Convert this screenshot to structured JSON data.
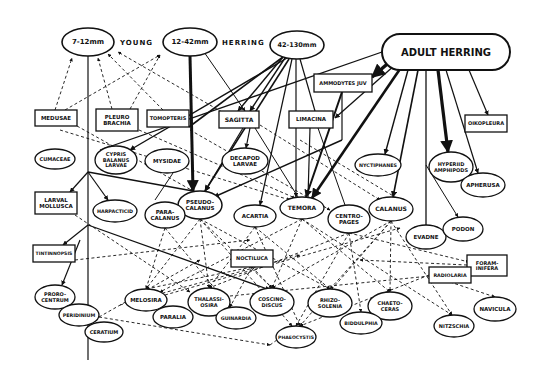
{
  "title_parts": {
    "young": "YOUNG",
    "herring": "HERRING"
  },
  "colors": {
    "ink": "#111111",
    "background": "#ffffff"
  },
  "nodes": [
    {
      "id": "n7_12",
      "shape": "ellipse",
      "cx": 88,
      "cy": 42,
      "rx": 26,
      "ry": 14,
      "lines": [
        "7-12mm"
      ],
      "fs": 7,
      "sw": 1.6
    },
    {
      "id": "n12_42",
      "shape": "ellipse",
      "cx": 190,
      "cy": 42,
      "rx": 27,
      "ry": 14,
      "lines": [
        "12-42mm"
      ],
      "fs": 7,
      "sw": 1.6
    },
    {
      "id": "n42_130",
      "shape": "ellipse",
      "cx": 297,
      "cy": 45,
      "rx": 27,
      "ry": 14,
      "lines": [
        "42-130mm"
      ],
      "fs": 6.5,
      "sw": 1.6
    },
    {
      "id": "adult",
      "shape": "rounded",
      "x": 382,
      "y": 34,
      "w": 128,
      "h": 36,
      "lines": [
        "ADULT HERRING"
      ],
      "fs": 10,
      "sw": 2
    },
    {
      "id": "ammodytes",
      "shape": "rect",
      "x": 314,
      "y": 74,
      "w": 58,
      "h": 18,
      "lines": [
        "AMMODYTES JUV"
      ],
      "fs": 5,
      "sw": 1.3
    },
    {
      "id": "medusae",
      "shape": "rect",
      "x": 35,
      "y": 110,
      "w": 42,
      "h": 16,
      "lines": [
        "MEDUSAE"
      ],
      "fs": 5.5,
      "sw": 1.3
    },
    {
      "id": "pleuro",
      "shape": "rect",
      "x": 96,
      "y": 109,
      "w": 42,
      "h": 22,
      "lines": [
        "PLEURO",
        "BRACHIA"
      ],
      "fs": 5.5,
      "sw": 1.3
    },
    {
      "id": "tomopteris",
      "shape": "rect",
      "x": 147,
      "y": 110,
      "w": 42,
      "h": 17,
      "lines": [
        "TOMOPTERIS"
      ],
      "fs": 5,
      "sw": 1.3
    },
    {
      "id": "sagitta",
      "shape": "rect",
      "x": 219,
      "y": 111,
      "w": 40,
      "h": 17,
      "lines": [
        "SAGITTA"
      ],
      "fs": 6,
      "sw": 1.3
    },
    {
      "id": "limacina",
      "shape": "rect",
      "x": 289,
      "y": 111,
      "w": 44,
      "h": 17,
      "lines": [
        "LIMACINA"
      ],
      "fs": 5.5,
      "sw": 1.3
    },
    {
      "id": "oikopleura",
      "shape": "rect",
      "x": 465,
      "y": 115,
      "w": 42,
      "h": 17,
      "lines": [
        "OIKOPLEURA"
      ],
      "fs": 5,
      "sw": 1.3
    },
    {
      "id": "cumaceae",
      "shape": "ellipse",
      "cx": 55,
      "cy": 159,
      "rx": 20,
      "ry": 10,
      "lines": [
        "CUMACEAE"
      ],
      "fs": 5,
      "sw": 1.3
    },
    {
      "id": "cypris",
      "shape": "ellipse",
      "cx": 116,
      "cy": 160,
      "rx": 21,
      "ry": 14,
      "lines": [
        "CYPRIS",
        "BALANUS",
        "LARVAE"
      ],
      "fs": 5,
      "sw": 1.3
    },
    {
      "id": "mysidae",
      "shape": "ellipse",
      "cx": 167,
      "cy": 161,
      "rx": 22,
      "ry": 12,
      "lines": [
        "MYSIDAE"
      ],
      "fs": 5.5,
      "sw": 1.3
    },
    {
      "id": "decapod",
      "shape": "ellipse",
      "cx": 245,
      "cy": 161,
      "rx": 23,
      "ry": 13,
      "lines": [
        "DECAPOD",
        "LARVAE"
      ],
      "fs": 5.5,
      "sw": 1.3
    },
    {
      "id": "nyctiphanes",
      "shape": "ellipse",
      "cx": 378,
      "cy": 165,
      "rx": 23,
      "ry": 11,
      "lines": [
        "NYCTIPHANES"
      ],
      "fs": 4.8,
      "sw": 1.3
    },
    {
      "id": "hyperiid",
      "shape": "ellipse",
      "cx": 451,
      "cy": 167,
      "rx": 22,
      "ry": 15,
      "lines": [
        "HYPERIID",
        "AMPHIPODS"
      ],
      "fs": 5,
      "sw": 1.3
    },
    {
      "id": "apherusa",
      "shape": "ellipse",
      "cx": 483,
      "cy": 185,
      "rx": 22,
      "ry": 12,
      "lines": [
        "APHERUSA"
      ],
      "fs": 5.5,
      "sw": 1.3
    },
    {
      "id": "larval_mollusca",
      "shape": "rect",
      "x": 35,
      "y": 192,
      "w": 42,
      "h": 22,
      "lines": [
        "LARVAL",
        "MOLLUSCA"
      ],
      "fs": 5.5,
      "sw": 1.3
    },
    {
      "id": "harpacticid",
      "shape": "ellipse",
      "cx": 115,
      "cy": 211,
      "rx": 22,
      "ry": 11,
      "lines": [
        "HARPACTICID"
      ],
      "fs": 4.8,
      "sw": 1.3
    },
    {
      "id": "pseudocalanus",
      "shape": "ellipse",
      "cx": 200,
      "cy": 205,
      "rx": 22,
      "ry": 14,
      "lines": [
        "PSEUDO-",
        "CALANUS"
      ],
      "fs": 5.5,
      "sw": 1.5
    },
    {
      "id": "paracalanus",
      "shape": "ellipse",
      "cx": 165,
      "cy": 215,
      "rx": 20,
      "ry": 13,
      "lines": [
        "PARA-",
        "CALANUS"
      ],
      "fs": 5.5,
      "sw": 1.3
    },
    {
      "id": "acartia",
      "shape": "ellipse",
      "cx": 255,
      "cy": 216,
      "rx": 21,
      "ry": 11,
      "lines": [
        "ACARTIA"
      ],
      "fs": 5.5,
      "sw": 1.3
    },
    {
      "id": "temora",
      "shape": "ellipse",
      "cx": 302,
      "cy": 208,
      "rx": 22,
      "ry": 11,
      "lines": [
        "TEMORA"
      ],
      "fs": 6,
      "sw": 1.3
    },
    {
      "id": "centropages",
      "shape": "ellipse",
      "cx": 349,
      "cy": 219,
      "rx": 21,
      "ry": 14,
      "lines": [
        "CENTRO-",
        "PAGES"
      ],
      "fs": 5.5,
      "sw": 1.3
    },
    {
      "id": "calanus",
      "shape": "ellipse",
      "cx": 391,
      "cy": 209,
      "rx": 22,
      "ry": 12,
      "lines": [
        "CALANUS"
      ],
      "fs": 6,
      "sw": 1.3
    },
    {
      "id": "evadne",
      "shape": "ellipse",
      "cx": 426,
      "cy": 237,
      "rx": 20,
      "ry": 12,
      "lines": [
        "EVADNE"
      ],
      "fs": 5.5,
      "sw": 1.3
    },
    {
      "id": "podon",
      "shape": "ellipse",
      "cx": 463,
      "cy": 229,
      "rx": 20,
      "ry": 12,
      "lines": [
        "PODON"
      ],
      "fs": 5.5,
      "sw": 1.3
    },
    {
      "id": "tintinnopsis",
      "shape": "rect",
      "x": 33,
      "y": 245,
      "w": 42,
      "h": 17,
      "lines": [
        "TINTINNOPSIS"
      ],
      "fs": 4.6,
      "sw": 1.3
    },
    {
      "id": "noctiluca",
      "shape": "rect",
      "x": 231,
      "y": 250,
      "w": 42,
      "h": 17,
      "lines": [
        "NOCTILUCA"
      ],
      "fs": 5,
      "sw": 1.3
    },
    {
      "id": "foraminifera",
      "shape": "rect",
      "x": 467,
      "y": 255,
      "w": 40,
      "h": 21,
      "lines": [
        "FORAM-",
        "INIFERA"
      ],
      "fs": 5,
      "sw": 1.3
    },
    {
      "id": "radiolaria",
      "shape": "rect",
      "x": 429,
      "y": 267,
      "w": 42,
      "h": 16,
      "lines": [
        "RADIOLARIA"
      ],
      "fs": 4.8,
      "sw": 1.3
    },
    {
      "id": "prorocentrum",
      "shape": "ellipse",
      "cx": 55,
      "cy": 297,
      "rx": 20,
      "ry": 12,
      "lines": [
        "PRORO-",
        "CENTRUM"
      ],
      "fs": 5,
      "sw": 1.3
    },
    {
      "id": "peridinium",
      "shape": "ellipse",
      "cx": 79,
      "cy": 315,
      "rx": 20,
      "ry": 11,
      "lines": [
        "PERIDINIUM"
      ],
      "fs": 4.8,
      "sw": 1.3
    },
    {
      "id": "ceratium",
      "shape": "ellipse",
      "cx": 104,
      "cy": 332,
      "rx": 19,
      "ry": 10,
      "lines": [
        "CERATIUM"
      ],
      "fs": 5,
      "sw": 1.3
    },
    {
      "id": "melosira",
      "shape": "ellipse",
      "cx": 146,
      "cy": 300,
      "rx": 21,
      "ry": 11,
      "lines": [
        "MELOSIRA"
      ],
      "fs": 5.5,
      "sw": 1.3
    },
    {
      "id": "paralia",
      "shape": "ellipse",
      "cx": 173,
      "cy": 317,
      "rx": 20,
      "ry": 11,
      "lines": [
        "PARALIA"
      ],
      "fs": 5.5,
      "sw": 1.3
    },
    {
      "id": "thalassiosira",
      "shape": "ellipse",
      "cx": 209,
      "cy": 302,
      "rx": 21,
      "ry": 14,
      "lines": [
        "THALASSI-",
        "OSIRA"
      ],
      "fs": 5,
      "sw": 1.3
    },
    {
      "id": "guinardia",
      "shape": "ellipse",
      "cx": 236,
      "cy": 318,
      "rx": 20,
      "ry": 11,
      "lines": [
        "GUINARDIA"
      ],
      "fs": 4.8,
      "sw": 1.3
    },
    {
      "id": "coscinodiscus",
      "shape": "ellipse",
      "cx": 272,
      "cy": 302,
      "rx": 22,
      "ry": 14,
      "lines": [
        "COSCINO-",
        "DISCUS"
      ],
      "fs": 5,
      "sw": 1.3
    },
    {
      "id": "rhizosolenia",
      "shape": "ellipse",
      "cx": 330,
      "cy": 303,
      "rx": 22,
      "ry": 14,
      "lines": [
        "RHIZO-",
        "SOLENIA"
      ],
      "fs": 5,
      "sw": 1.3
    },
    {
      "id": "chaetoceras",
      "shape": "ellipse",
      "cx": 390,
      "cy": 306,
      "rx": 22,
      "ry": 14,
      "lines": [
        "CHAETO-",
        "CERAS"
      ],
      "fs": 5,
      "sw": 1.3
    },
    {
      "id": "biddulphia",
      "shape": "ellipse",
      "cx": 361,
      "cy": 323,
      "rx": 21,
      "ry": 11,
      "lines": [
        "BIDDULPHIA"
      ],
      "fs": 4.8,
      "sw": 1.3
    },
    {
      "id": "phaeocystis",
      "shape": "ellipse",
      "cx": 296,
      "cy": 337,
      "rx": 20,
      "ry": 11,
      "lines": [
        "PHAEOCYSTIS"
      ],
      "fs": 4.6,
      "sw": 1.3
    },
    {
      "id": "nitzschia",
      "shape": "ellipse",
      "cx": 454,
      "cy": 326,
      "rx": 20,
      "ry": 11,
      "lines": [
        "NITZSCHIA"
      ],
      "fs": 5,
      "sw": 1.3
    },
    {
      "id": "navicula",
      "shape": "ellipse",
      "cx": 495,
      "cy": 309,
      "rx": 21,
      "ry": 12,
      "lines": [
        "NAVICULA"
      ],
      "fs": 5.5,
      "sw": 1.3
    }
  ],
  "solid_edges": [
    {
      "x1": 88,
      "y1": 56,
      "x2": 88,
      "y2": 360,
      "w": 1.2,
      "arrow": false
    },
    {
      "x1": 190,
      "y1": 56,
      "x2": 193,
      "y2": 191,
      "w": 3,
      "arrow": true
    },
    {
      "x1": 204,
      "y1": 52,
      "x2": 245,
      "y2": 111,
      "w": 1,
      "arrow": true
    },
    {
      "x1": 283,
      "y1": 57,
      "x2": 189,
      "y2": 127,
      "w": 1.6,
      "arrow": false
    },
    {
      "x1": 283,
      "y1": 57,
      "x2": 238,
      "y2": 111,
      "w": 1.4,
      "arrow": true
    },
    {
      "x1": 285,
      "y1": 58,
      "x2": 250,
      "y2": 111,
      "w": 1.4,
      "arrow": true
    },
    {
      "x1": 287,
      "y1": 58,
      "x2": 130,
      "y2": 150,
      "w": 1.4,
      "arrow": true
    },
    {
      "x1": 289,
      "y1": 59,
      "x2": 205,
      "y2": 191,
      "w": 1.6,
      "arrow": true
    },
    {
      "x1": 292,
      "y1": 59,
      "x2": 260,
      "y2": 205,
      "w": 1.2,
      "arrow": true
    },
    {
      "x1": 296,
      "y1": 59,
      "x2": 296,
      "y2": 197,
      "w": 1.2,
      "arrow": true
    },
    {
      "x1": 300,
      "y1": 59,
      "x2": 315,
      "y2": 111,
      "w": 1.2,
      "arrow": false
    },
    {
      "x1": 243,
      "y1": 128,
      "x2": 205,
      "y2": 191,
      "w": 1.2,
      "arrow": true
    },
    {
      "x1": 250,
      "y1": 128,
      "x2": 246,
      "y2": 148,
      "w": 1.2,
      "arrow": true
    },
    {
      "x1": 255,
      "y1": 128,
      "x2": 298,
      "y2": 197,
      "w": 1,
      "arrow": false
    },
    {
      "x1": 310,
      "y1": 128,
      "x2": 308,
      "y2": 197,
      "w": 1.2,
      "arrow": false
    },
    {
      "x1": 318,
      "y1": 128,
      "x2": 345,
      "y2": 205,
      "w": 1,
      "arrow": false
    },
    {
      "x1": 382,
      "y1": 52,
      "x2": 100,
      "y2": 150,
      "w": 1.3,
      "arrow": false
    },
    {
      "x1": 392,
      "y1": 60,
      "x2": 372,
      "y2": 77,
      "w": 3.5,
      "arrow": true
    },
    {
      "x1": 395,
      "y1": 65,
      "x2": 335,
      "y2": 118,
      "w": 1.3,
      "arrow": true
    },
    {
      "x1": 400,
      "y1": 69,
      "x2": 312,
      "y2": 198,
      "w": 2.6,
      "arrow": true
    },
    {
      "x1": 408,
      "y1": 70,
      "x2": 385,
      "y2": 154,
      "w": 1.4,
      "arrow": true
    },
    {
      "x1": 418,
      "y1": 70,
      "x2": 393,
      "y2": 197,
      "w": 1.6,
      "arrow": true
    },
    {
      "x1": 426,
      "y1": 70,
      "x2": 426,
      "y2": 225,
      "w": 1.3,
      "arrow": false
    },
    {
      "x1": 438,
      "y1": 70,
      "x2": 448,
      "y2": 152,
      "w": 3.2,
      "arrow": true
    },
    {
      "x1": 446,
      "y1": 70,
      "x2": 478,
      "y2": 173,
      "w": 1.2,
      "arrow": true
    },
    {
      "x1": 469,
      "y1": 70,
      "x2": 488,
      "y2": 115,
      "w": 1.2,
      "arrow": true
    },
    {
      "x1": 426,
      "y1": 165,
      "x2": 458,
      "y2": 217,
      "w": 1,
      "arrow": true
    },
    {
      "x1": 342,
      "y1": 92,
      "x2": 342,
      "y2": 140,
      "w": 1.2,
      "arrow": false
    },
    {
      "x1": 342,
      "y1": 140,
      "x2": 214,
      "y2": 197,
      "w": 1.4,
      "arrow": true
    },
    {
      "x1": 342,
      "y1": 92,
      "x2": 306,
      "y2": 197,
      "w": 2,
      "arrow": true
    },
    {
      "x1": 88,
      "y1": 172,
      "x2": 193,
      "y2": 191,
      "w": 1.3,
      "arrow": false
    },
    {
      "x1": 88,
      "y1": 172,
      "x2": 70,
      "y2": 192,
      "w": 1.2,
      "arrow": true
    },
    {
      "x1": 88,
      "y1": 172,
      "x2": 108,
      "y2": 200,
      "w": 1.2,
      "arrow": true
    },
    {
      "x1": 88,
      "y1": 225,
      "x2": 63,
      "y2": 245,
      "w": 1.2,
      "arrow": true
    },
    {
      "x1": 88,
      "y1": 225,
      "x2": 270,
      "y2": 290,
      "w": 1.3,
      "arrow": true
    },
    {
      "x1": 80,
      "y1": 240,
      "x2": 62,
      "y2": 285,
      "w": 1.2,
      "arrow": true
    },
    {
      "x1": 175,
      "y1": 170,
      "x2": 155,
      "y2": 200,
      "w": 1,
      "arrow": false
    }
  ],
  "dashed_edges": [
    {
      "x1": 55,
      "y1": 110,
      "x2": 72,
      "y2": 58
    },
    {
      "x1": 65,
      "y1": 110,
      "x2": 160,
      "y2": 55
    },
    {
      "x1": 112,
      "y1": 109,
      "x2": 98,
      "y2": 58
    },
    {
      "x1": 130,
      "y1": 109,
      "x2": 160,
      "y2": 55
    },
    {
      "x1": 163,
      "y1": 110,
      "x2": 108,
      "y2": 54
    },
    {
      "x1": 222,
      "y1": 112,
      "x2": 118,
      "y2": 52
    },
    {
      "x1": 77,
      "y1": 126,
      "x2": 193,
      "y2": 191
    },
    {
      "x1": 60,
      "y1": 130,
      "x2": 290,
      "y2": 200
    },
    {
      "x1": 139,
      "y1": 130,
      "x2": 295,
      "y2": 198
    },
    {
      "x1": 260,
      "y1": 125,
      "x2": 380,
      "y2": 200
    },
    {
      "x1": 190,
      "y1": 130,
      "x2": 330,
      "y2": 210
    },
    {
      "x1": 300,
      "y1": 140,
      "x2": 400,
      "y2": 200
    },
    {
      "x1": 75,
      "y1": 215,
      "x2": 190,
      "y2": 292
    },
    {
      "x1": 75,
      "y1": 260,
      "x2": 250,
      "y2": 240
    },
    {
      "x1": 200,
      "y1": 219,
      "x2": 146,
      "y2": 289
    },
    {
      "x1": 200,
      "y1": 219,
      "x2": 209,
      "y2": 288
    },
    {
      "x1": 200,
      "y1": 219,
      "x2": 272,
      "y2": 288
    },
    {
      "x1": 200,
      "y1": 219,
      "x2": 330,
      "y2": 289
    },
    {
      "x1": 200,
      "y1": 219,
      "x2": 292,
      "y2": 326
    },
    {
      "x1": 165,
      "y1": 228,
      "x2": 146,
      "y2": 289
    },
    {
      "x1": 165,
      "y1": 228,
      "x2": 230,
      "y2": 307
    },
    {
      "x1": 255,
      "y1": 227,
      "x2": 209,
      "y2": 288
    },
    {
      "x1": 255,
      "y1": 227,
      "x2": 330,
      "y2": 289
    },
    {
      "x1": 255,
      "y1": 227,
      "x2": 300,
      "y2": 326
    },
    {
      "x1": 302,
      "y1": 219,
      "x2": 160,
      "y2": 292
    },
    {
      "x1": 302,
      "y1": 219,
      "x2": 272,
      "y2": 288
    },
    {
      "x1": 302,
      "y1": 219,
      "x2": 390,
      "y2": 292
    },
    {
      "x1": 302,
      "y1": 219,
      "x2": 452,
      "y2": 315
    },
    {
      "x1": 349,
      "y1": 233,
      "x2": 209,
      "y2": 288
    },
    {
      "x1": 349,
      "y1": 233,
      "x2": 361,
      "y2": 312
    },
    {
      "x1": 349,
      "y1": 233,
      "x2": 469,
      "y2": 262
    },
    {
      "x1": 349,
      "y1": 233,
      "x2": 296,
      "y2": 326
    },
    {
      "x1": 391,
      "y1": 221,
      "x2": 272,
      "y2": 288
    },
    {
      "x1": 391,
      "y1": 221,
      "x2": 330,
      "y2": 289
    },
    {
      "x1": 391,
      "y1": 221,
      "x2": 390,
      "y2": 292
    },
    {
      "x1": 391,
      "y1": 221,
      "x2": 452,
      "y2": 315
    },
    {
      "x1": 391,
      "y1": 221,
      "x2": 300,
      "y2": 326
    },
    {
      "x1": 252,
      "y1": 267,
      "x2": 230,
      "y2": 307
    },
    {
      "x1": 252,
      "y1": 267,
      "x2": 272,
      "y2": 288
    },
    {
      "x1": 252,
      "y1": 267,
      "x2": 146,
      "y2": 289
    },
    {
      "x1": 429,
      "y1": 275,
      "x2": 300,
      "y2": 326
    },
    {
      "x1": 429,
      "y1": 275,
      "x2": 495,
      "y2": 297
    },
    {
      "x1": 467,
      "y1": 265,
      "x2": 360,
      "y2": 260
    },
    {
      "x1": 99,
      "y1": 317,
      "x2": 270,
      "y2": 345
    },
    {
      "x1": 270,
      "y1": 345,
      "x2": 296,
      "y2": 326
    },
    {
      "x1": 99,
      "y1": 317,
      "x2": 200,
      "y2": 260
    },
    {
      "x1": 120,
      "y1": 305,
      "x2": 300,
      "y2": 255
    },
    {
      "x1": 165,
      "y1": 295,
      "x2": 400,
      "y2": 228
    },
    {
      "x1": 230,
      "y1": 296,
      "x2": 450,
      "y2": 274
    }
  ]
}
